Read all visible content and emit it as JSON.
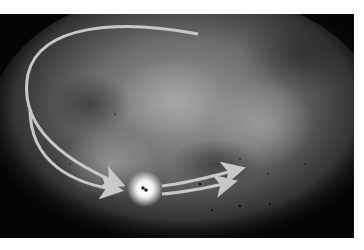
{
  "image": {
    "description": "Illustration of a diffuse grey nebula/galaxy cloud on black background with curved arrows converging on a bright glowing point and continuing to the right",
    "colors": {
      "background": "#050505",
      "cloud": "#8a8a8a",
      "arrow": "#c8c8c8",
      "glow": "#ffffff",
      "border": "#ffffff"
    },
    "elements": [
      "nebula-cloud",
      "curved-arrow-outer",
      "curved-arrow-inner",
      "glowing-point",
      "outgoing-arrows"
    ]
  }
}
